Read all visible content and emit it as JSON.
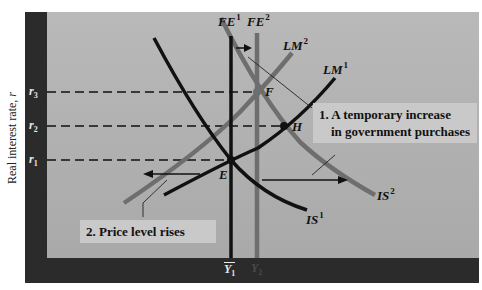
{
  "axes": {
    "y_label": "Real interest rate, ",
    "y_label_var": "r",
    "y_ticks": [
      {
        "base": "r",
        "sub": "3"
      },
      {
        "base": "r",
        "sub": "2"
      },
      {
        "base": "r",
        "sub": "1"
      }
    ],
    "x_ticks": [
      {
        "base": "Y",
        "sub": "1",
        "bar": true
      },
      {
        "base": "Y",
        "sub": "2",
        "bar": true,
        "faded": true
      }
    ]
  },
  "curves": {
    "fe1": {
      "base": "FE",
      "sup": "1"
    },
    "fe2": {
      "base": "FE",
      "sup": "2"
    },
    "lm1": {
      "base": "LM",
      "sup": "1"
    },
    "lm2": {
      "base": "LM",
      "sup": "2"
    },
    "is1": {
      "base": "IS",
      "sup": "1"
    },
    "is2": {
      "base": "IS",
      "sup": "2"
    }
  },
  "points": {
    "e": "E",
    "f": "F",
    "h": "H"
  },
  "callouts": {
    "one_line1": "1. A temporary increase",
    "one_line2": "in government purchases",
    "two": "2.  Price level rises"
  },
  "colors": {
    "frame": "#2b2b2b",
    "plot_bg": "#b1b1b1",
    "primary_curve": "#111111",
    "shifted_curve": "#6e6e6e",
    "callout_bg": "#c9c9c9"
  }
}
